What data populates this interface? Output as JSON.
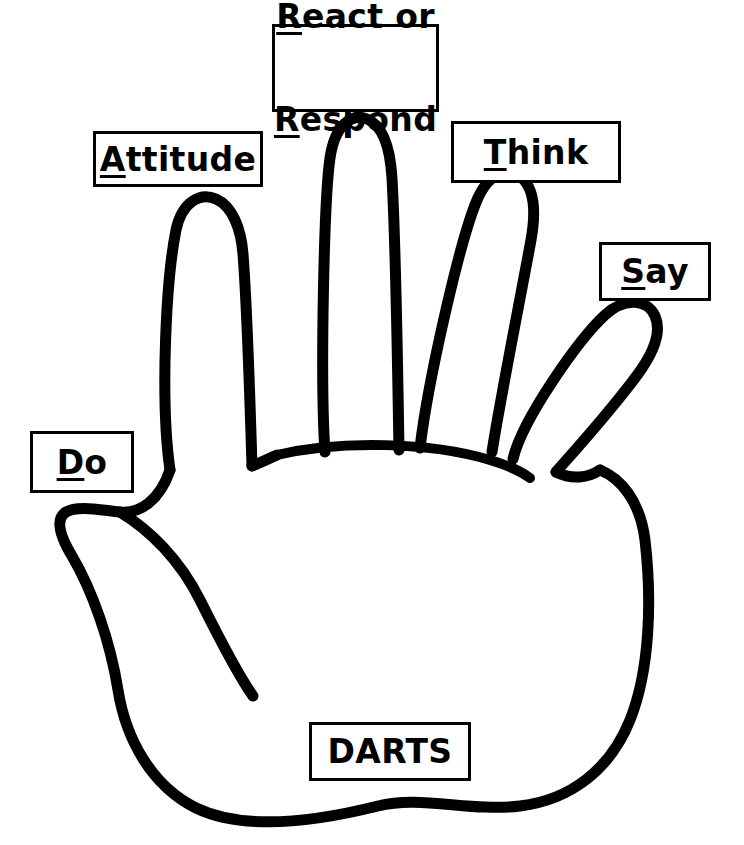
{
  "diagram": {
    "title": "DARTS",
    "stroke_color": "#000000",
    "background_color": "#ffffff",
    "box_border_color": "#000000",
    "text_color": "#000000"
  },
  "labels": {
    "react_respond": {
      "line1_underlined": "R",
      "line1_rest": "eact or",
      "line2_underlined": "R",
      "line2_rest": "espond",
      "full_text": "React or Respond"
    },
    "attitude": {
      "underlined": "A",
      "rest": "ttitude",
      "full_text": "Attitude"
    },
    "think": {
      "underlined": "T",
      "rest": "hink",
      "full_text": "Think"
    },
    "say": {
      "underlined": "S",
      "rest": "ay",
      "full_text": "Say"
    },
    "do": {
      "underlined": "D",
      "rest": "o",
      "full_text": "Do"
    },
    "darts": {
      "full_text": "DARTS"
    }
  },
  "acronym": {
    "name": "DARTS",
    "letters": [
      {
        "letter": "D",
        "word": "Do"
      },
      {
        "letter": "A",
        "word": "Attitude"
      },
      {
        "letter": "R",
        "word": "React or Respond"
      },
      {
        "letter": "T",
        "word": "Think"
      },
      {
        "letter": "S",
        "word": "Say"
      }
    ]
  }
}
